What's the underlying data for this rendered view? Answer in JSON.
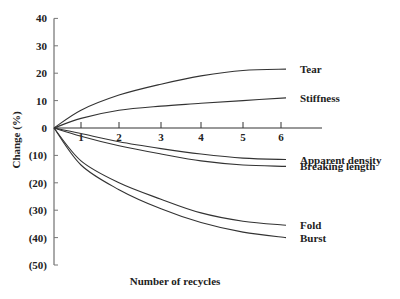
{
  "chart_data": {
    "type": "line",
    "title": "",
    "xlabel": "Number of recycles",
    "ylabel": "Change (%)",
    "x_ticks": [
      "1",
      "2",
      "3",
      "4",
      "5",
      "6"
    ],
    "y_ticks": [
      "40",
      "30",
      "20",
      "10",
      "0",
      "(10)",
      "(20)",
      "(30)",
      "(40)",
      "(50)"
    ],
    "xlim": [
      0,
      6.5
    ],
    "ylim": [
      -50,
      40
    ],
    "grid": false,
    "legend_position": "inline-right",
    "x": [
      0,
      1,
      2,
      3,
      4,
      5,
      6
    ],
    "series": [
      {
        "name": "Tear",
        "values": [
          0,
          6.5,
          12,
          16,
          19,
          21,
          21.5
        ]
      },
      {
        "name": "Stiffness",
        "values": [
          0,
          3.5,
          6.5,
          8,
          9,
          10,
          11
        ]
      },
      {
        "name": "Apparent density",
        "values": [
          0,
          -2,
          -5,
          -7.5,
          -9.5,
          -11,
          -11.5
        ]
      },
      {
        "name": "Breaking length",
        "values": [
          0,
          -3,
          -6.5,
          -9.5,
          -12,
          -13.5,
          -14
        ]
      },
      {
        "name": "Fold",
        "values": [
          0,
          -12,
          -20,
          -26,
          -31,
          -34,
          -35.5
        ]
      },
      {
        "name": "Burst",
        "values": [
          0,
          -13.5,
          -22.5,
          -29.5,
          -34.5,
          -38,
          -40
        ]
      }
    ]
  }
}
